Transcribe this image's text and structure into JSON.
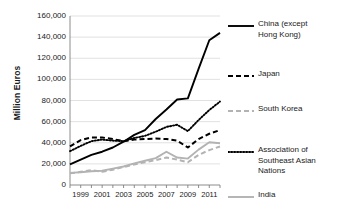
{
  "chart_data": {
    "type": "line",
    "title": "",
    "xlabel": "",
    "ylabel": "Million Euros",
    "xlim": [
      1998,
      2012
    ],
    "ylim": [
      0,
      160000
    ],
    "grid": true,
    "legend_position": "right",
    "x": [
      1998,
      1999,
      2000,
      2001,
      2002,
      2003,
      2004,
      2005,
      2006,
      2007,
      2008,
      2009,
      2010,
      2011,
      2012
    ],
    "xticklabels": [
      "1999",
      "2001",
      "2003",
      "2005",
      "2007",
      "2009",
      "2011"
    ],
    "xtickvalues": [
      1999,
      2001,
      2003,
      2005,
      2007,
      2009,
      2011
    ],
    "yticklabels": [
      "0",
      "20,000",
      "40,000",
      "60,000",
      "80,000",
      "100,000",
      "120,000",
      "140,000",
      "160,000"
    ],
    "ytickvalues": [
      0,
      20000,
      40000,
      60000,
      80000,
      100000,
      120000,
      140000,
      160000
    ],
    "series": [
      {
        "name": "China (except Hong Kong)",
        "style": "solid",
        "color": "#000000",
        "values": [
          19500,
          24000,
          28500,
          31500,
          35500,
          41000,
          47500,
          52000,
          62500,
          71500,
          81000,
          82000,
          110000,
          137000,
          144000
        ]
      },
      {
        "name": "Japan",
        "style": "dashed",
        "color": "#000000",
        "values": [
          36500,
          42500,
          45000,
          45000,
          43500,
          41500,
          43000,
          43500,
          44000,
          43500,
          42000,
          35500,
          43500,
          48500,
          52000
        ]
      },
      {
        "name": "South Korea",
        "style": "dashed",
        "color": "#b3b3b3",
        "values": [
          11000,
          12500,
          14000,
          12500,
          14500,
          17000,
          19500,
          21500,
          23500,
          26000,
          24000,
          21500,
          28500,
          33000,
          36500
        ]
      },
      {
        "name": "Association of Southeast Asian Nations",
        "style": "dotted",
        "color": "#000000",
        "values": [
          32000,
          37000,
          41500,
          43000,
          42000,
          41500,
          44500,
          46500,
          50500,
          55000,
          57000,
          51000,
          61500,
          71000,
          79000
        ]
      },
      {
        "name": "India",
        "style": "solid",
        "color": "#b3b3b3",
        "values": [
          11500,
          12000,
          13000,
          13500,
          15500,
          17500,
          20500,
          23000,
          25500,
          31500,
          26000,
          25000,
          33500,
          40500,
          39500
        ]
      }
    ]
  },
  "legend": {
    "entries": [
      {
        "label": "China (except\nHong Kong)",
        "swatch": "solid-black-line-icon"
      },
      {
        "label": "Japan",
        "swatch": "dashed-black-line-icon"
      },
      {
        "label": "South Korea",
        "swatch": "dashed-gray-line-icon"
      },
      {
        "label": "Association of\nSoutheast Asian\nNations",
        "swatch": "dotted-black-line-icon"
      },
      {
        "label": "India",
        "swatch": "solid-gray-line-icon"
      }
    ]
  },
  "colors": {
    "axis": "#808080",
    "grid": "#d9d9d9",
    "dark_series": "#000000",
    "light_series": "#b3b3b3",
    "text": "#1a1a1a"
  }
}
